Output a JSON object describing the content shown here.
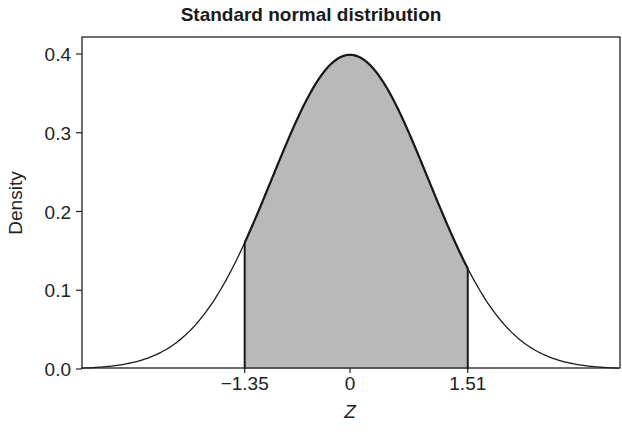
{
  "chart_data": {
    "type": "area",
    "title": "Standard normal distribution",
    "xlabel": "Z",
    "ylabel": "Density",
    "xlim": [
      -3.45,
      3.45
    ],
    "ylim": [
      0,
      0.42
    ],
    "x_ticks": [
      -1.35,
      0,
      1.51
    ],
    "x_tick_labels": [
      "−1.35",
      "0",
      "1.51"
    ],
    "y_ticks": [
      0.0,
      0.1,
      0.2,
      0.3,
      0.4
    ],
    "y_tick_labels": [
      "0.0",
      "0.1",
      "0.2",
      "0.3",
      "0.4"
    ],
    "grid": false,
    "legend": null,
    "series": [
      {
        "name": "Standard normal density",
        "function": "pdf(z) = exp(-z^2/2)/sqrt(2*pi)",
        "x": [
          -3.4,
          -3,
          -2.5,
          -2,
          -1.5,
          -1.35,
          -1,
          -0.5,
          0,
          0.5,
          1,
          1.5,
          1.51,
          2,
          2.5,
          3,
          3.4
        ],
        "values": [
          0.0012,
          0.0044,
          0.0175,
          0.054,
          0.1295,
          0.1604,
          0.242,
          0.3521,
          0.3989,
          0.3521,
          0.242,
          0.1295,
          0.1276,
          0.054,
          0.0175,
          0.0044,
          0.0012
        ]
      }
    ],
    "shaded_region": {
      "from": -1.35,
      "to": 1.51,
      "fill": "#b9b9b9",
      "area": 0.8461
    },
    "colors": {
      "curve": "#1a1a1a",
      "fill": "#b9b9b9",
      "frame": "#222222"
    }
  }
}
